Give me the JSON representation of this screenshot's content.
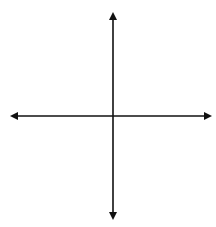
{
  "diagram": {
    "type": "coordinate-grid",
    "grid": {
      "columns": 8,
      "rows": 8,
      "x_min": -4,
      "x_max": 4,
      "y_min": -4,
      "y_max": 4
    },
    "origin_label": "0",
    "points": [
      {
        "label": "C",
        "x": -2,
        "y": 3
      },
      {
        "label": "B",
        "x": -2,
        "y": -1
      },
      {
        "label": "D",
        "x": 1,
        "y": -1
      }
    ],
    "colors": {
      "grid": "#555555",
      "axis": "#111111",
      "point": "#000000"
    }
  }
}
